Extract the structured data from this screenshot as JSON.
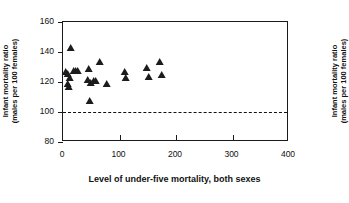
{
  "chart_data": {
    "type": "scatter",
    "title": "",
    "xlabel": "Level of under-five mortality, both sexes",
    "ylabel": "Infant mortality ratio (males per 100 females)",
    "ylabel_line1": "Infant mortality ratio",
    "ylabel_line2": "(males per 100 females)",
    "ylabel_right_line1": "Infant mortality ratio",
    "ylabel_right_line2": "(males per 100 females)",
    "xlim": [
      0,
      400
    ],
    "ylim": [
      80,
      160
    ],
    "xticks": [
      0,
      100,
      200,
      300,
      400
    ],
    "xtick_labels": [
      "0",
      "100",
      "200",
      "300",
      "400"
    ],
    "yticks": [
      80,
      100,
      120,
      140,
      160
    ],
    "ytick_labels": [
      "80",
      "100",
      "120",
      "140",
      "160"
    ],
    "grid": false,
    "legend": "none",
    "marker": "triangle-up",
    "marker_color": "#1c1c1c",
    "reference_line": {
      "axis": "y",
      "value": 100,
      "style": "dashed",
      "color": "#111111"
    },
    "points": [
      {
        "x": 14,
        "y": 142
      },
      {
        "x": 6,
        "y": 126
      },
      {
        "x": 9,
        "y": 125
      },
      {
        "x": 19,
        "y": 127
      },
      {
        "x": 23,
        "y": 127
      },
      {
        "x": 26,
        "y": 127
      },
      {
        "x": 8,
        "y": 118
      },
      {
        "x": 11,
        "y": 116
      },
      {
        "x": 12,
        "y": 122
      },
      {
        "x": 46,
        "y": 128
      },
      {
        "x": 66,
        "y": 133
      },
      {
        "x": 44,
        "y": 121
      },
      {
        "x": 50,
        "y": 119
      },
      {
        "x": 54,
        "y": 120
      },
      {
        "x": 58,
        "y": 120
      },
      {
        "x": 47,
        "y": 107
      },
      {
        "x": 77,
        "y": 118
      },
      {
        "x": 109,
        "y": 126
      },
      {
        "x": 112,
        "y": 122
      },
      {
        "x": 148,
        "y": 129
      },
      {
        "x": 153,
        "y": 123
      },
      {
        "x": 171,
        "y": 133
      },
      {
        "x": 175,
        "y": 124
      }
    ]
  }
}
